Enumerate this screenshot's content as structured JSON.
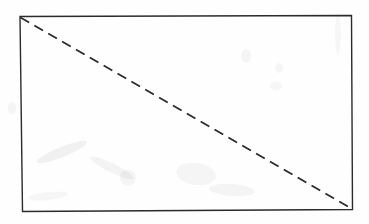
{
  "document": {
    "type": "scanned-geometry-figure",
    "title": "Rectangle with dashed diagonal",
    "width": 369,
    "height": 224,
    "background_color": "#fefefe",
    "paper_tint": "#fcfcfc",
    "has_text_labels": false,
    "label_text": ""
  },
  "figure": {
    "stroke_color": "#2b2b2b",
    "stroke_color_light": "#4a4a4a",
    "rectangle": {
      "name": "rectangle-outline",
      "style": "solid",
      "stroke_width": 1.4,
      "corners": {
        "top_left": {
          "x": 20,
          "y": 16.5
        },
        "top_right": {
          "x": 351.5,
          "y": 15.5
        },
        "bottom_right": {
          "x": 352.5,
          "y": 209.5
        },
        "bottom_left": {
          "x": 22.5,
          "y": 211.5
        }
      },
      "width_px": 331,
      "height_px": 194
    },
    "diagonal": {
      "name": "dashed-diagonal",
      "style": "dashed",
      "stroke_width": 1.8,
      "dash_length": 10,
      "gap_length": 6,
      "start": {
        "x": 20.5,
        "y": 17.5
      },
      "end": {
        "x": 351.5,
        "y": 208.5
      },
      "from_corner": "top-left",
      "to_corner": "bottom-right"
    },
    "smudges": [
      {
        "x": 62,
        "y": 152,
        "w": 54,
        "h": 10,
        "r": -22,
        "o": 0.05
      },
      {
        "x": 112,
        "y": 168,
        "w": 48,
        "h": 9,
        "r": 26,
        "o": 0.045
      },
      {
        "x": 128,
        "y": 178,
        "w": 16,
        "h": 16,
        "r": 0,
        "o": 0.04
      },
      {
        "x": 196,
        "y": 174,
        "w": 40,
        "h": 22,
        "r": 8,
        "o": 0.035
      },
      {
        "x": 232,
        "y": 190,
        "w": 46,
        "h": 12,
        "r": 4,
        "o": 0.04
      },
      {
        "x": 246,
        "y": 56,
        "w": 10,
        "h": 14,
        "r": 0,
        "o": 0.035
      },
      {
        "x": 279,
        "y": 68,
        "w": 8,
        "h": 10,
        "r": 0,
        "o": 0.03
      },
      {
        "x": 276,
        "y": 86,
        "w": 12,
        "h": 9,
        "r": 0,
        "o": 0.03
      },
      {
        "x": 12,
        "y": 108,
        "w": 9,
        "h": 12,
        "r": 0,
        "o": 0.035
      },
      {
        "x": 338,
        "y": 34,
        "w": 6,
        "h": 40,
        "r": 0,
        "o": 0.03
      },
      {
        "x": 48,
        "y": 196,
        "w": 40,
        "h": 8,
        "r": -6,
        "o": 0.03
      }
    ]
  }
}
